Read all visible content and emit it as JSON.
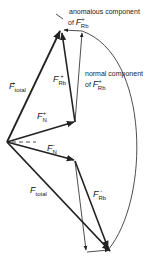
{
  "diagram": {
    "type": "vector-diagram",
    "colors": {
      "stroke": "#222222",
      "background": "#ffffff"
    },
    "labels": {
      "anomalous_line1": "anomalous component",
      "anomalous_line2_prefix": "of",
      "normal_line1": "normal component",
      "normal_line2_prefix": "of",
      "F": "F",
      "sub_total": "total",
      "sub_Rb": "Rb",
      "sub_N": "N",
      "plus": "+",
      "minus": "-"
    },
    "vectors": [
      {
        "name": "F_total_plus",
        "from": [
          7,
          142
        ],
        "to": [
          60,
          30
        ]
      },
      {
        "name": "F_N_plus",
        "from": [
          7,
          142
        ],
        "to": [
          75,
          122
        ]
      },
      {
        "name": "F_Rb_plus",
        "from": [
          75,
          122
        ],
        "to": [
          62,
          31
        ]
      },
      {
        "name": "normal_component_plus",
        "from": [
          75,
          122
        ],
        "to": [
          82,
          31
        ]
      },
      {
        "name": "anomalous_component_plus",
        "from": [
          82,
          31
        ],
        "to": [
          63,
          30
        ]
      },
      {
        "name": "F_N_minus",
        "from": [
          7,
          142
        ],
        "to": [
          75,
          160
        ]
      },
      {
        "name": "F_total_minus",
        "from": [
          7,
          142
        ],
        "to": [
          110,
          252
        ]
      },
      {
        "name": "F_Rb_minus",
        "from": [
          75,
          160
        ],
        "to": [
          108,
          250
        ]
      },
      {
        "name": "normal_component_minus",
        "from": [
          75,
          160
        ],
        "to": [
          87,
          252
        ]
      },
      {
        "name": "anomalous_component_minus",
        "from": [
          87,
          252
        ],
        "to": [
          110,
          250
        ]
      }
    ]
  }
}
